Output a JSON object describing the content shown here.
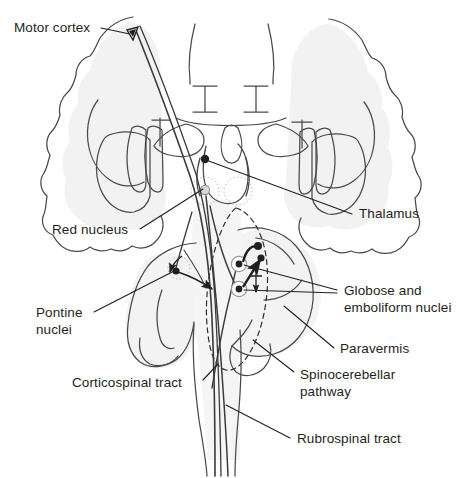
{
  "figure": {
    "type": "anatomical-diagram",
    "width": 462,
    "height": 478,
    "background_color": "#ffffff",
    "line_color": "#231f20",
    "fill_shadow_color": "#e8e8e8",
    "tract_color": "#3a3a3a"
  },
  "labels": {
    "motor_cortex": "Motor cortex",
    "thalamus": "Thalamus",
    "red_nucleus": "Red nucleus",
    "pontine_nuclei": "Pontine\nnuclei",
    "corticospinal_tract": "Corticospinal tract",
    "globose_emboliform": "Globose and\nemboliform nuclei",
    "paravermis": "Paravermis",
    "spinocerebellar_pathway": "Spinocerebellar\npathway",
    "rubrospinal_tract": "Rubrospinal tract"
  },
  "structures": [
    {
      "name": "cerebral-hemispheres",
      "label": "Cerebral hemispheres (coronal section)"
    },
    {
      "name": "lateral-ventricles",
      "label": "Lateral ventricles"
    },
    {
      "name": "basal-ganglia",
      "label": "Basal ganglia"
    },
    {
      "name": "thalamus-body",
      "label": "Thalamus"
    },
    {
      "name": "midbrain",
      "label": "Midbrain"
    },
    {
      "name": "pons",
      "label": "Pons"
    },
    {
      "name": "cerebellum",
      "label": "Cerebellum"
    },
    {
      "name": "paravermal-zone",
      "label": "Paravermal zone (dashed outline)"
    },
    {
      "name": "medulla-spinal-cord",
      "label": "Medulla and spinal cord"
    }
  ],
  "pathway_nodes": [
    {
      "name": "motor-cortex-node",
      "shape": "triangle-neuron",
      "x": 131,
      "y": 34
    },
    {
      "name": "thalamus-node",
      "shape": "filled-dot",
      "x": 205,
      "y": 159
    },
    {
      "name": "red-nucleus-node",
      "shape": "open-circle",
      "x": 205,
      "y": 190
    },
    {
      "name": "pontine-nucleus-node",
      "shape": "filled-dot",
      "x": 175,
      "y": 271
    },
    {
      "name": "globose-node-upper",
      "shape": "circled-dot",
      "x": 239,
      "y": 264
    },
    {
      "name": "emboliform-node-lower",
      "shape": "circled-dot",
      "x": 239,
      "y": 288
    },
    {
      "name": "cerebellar-cortex-node-1",
      "shape": "filled-dot",
      "x": 257,
      "y": 248
    },
    {
      "name": "cerebellar-cortex-node-2",
      "shape": "filled-dot",
      "x": 259,
      "y": 259
    }
  ],
  "tracts": [
    {
      "name": "corticospinal-tract",
      "label": "Corticospinal tract"
    },
    {
      "name": "rubrospinal-tract",
      "label": "Rubrospinal tract"
    },
    {
      "name": "spinocerebellar-pathway",
      "label": "Spinocerebellar pathway"
    }
  ]
}
